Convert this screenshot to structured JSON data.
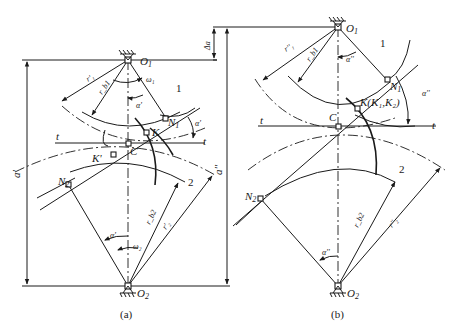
{
  "figure": {
    "panel_a": {
      "caption": "(a)",
      "labels": {
        "O1": "O",
        "O1_sub": "1",
        "O2": "O",
        "O2_sub": "2",
        "N1": "N",
        "N1_sub": "1",
        "N2": "N",
        "N2_sub": "2",
        "K": "K",
        "K_prime": "K'",
        "C": "C",
        "t_left": "t",
        "t_right": "t",
        "gear1": "1",
        "gear2": "2",
        "omega1": "ω₁",
        "omega2": "ω₂",
        "alpha_prime_1": "α'",
        "alpha_prime_2": "α'",
        "alpha_prime_3": "α'",
        "r1_prime": "r'₁",
        "rb1": "r_b1",
        "rb2": "r_b2",
        "r2_prime": "r'₂",
        "center_distance": "a'"
      }
    },
    "panel_b": {
      "caption": "(b)",
      "labels": {
        "O1": "O",
        "O1_sub": "1",
        "O2": "O",
        "O2_sub": "2",
        "N1": "N",
        "N1_sub": "1",
        "N2": "N",
        "N2_sub": "2",
        "K": "K(K₁,K₂)",
        "C": "C",
        "t_left": "t",
        "t_right": "t",
        "gear1": "1",
        "gear2": "2",
        "alpha_dprime_1": "α''",
        "alpha_dprime_2": "α''",
        "alpha_dprime_3": "α''",
        "r1_dprime": "r''₁",
        "rb1": "r_b1",
        "rb2": "r_b2",
        "r2_dprime": "r''₂",
        "center_distance": "a''",
        "delta_a": "Δa"
      }
    }
  }
}
